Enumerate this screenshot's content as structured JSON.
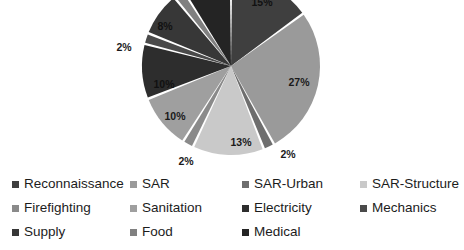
{
  "chart_data": {
    "type": "pie",
    "title": "",
    "legend_position": "bottom",
    "labels": [
      "Reconnaissance",
      "SAR",
      "SAR-Urban",
      "SAR-Structure",
      "Firefighting",
      "Sanitation",
      "Electricity",
      "Mechanics",
      "Supply",
      "Food",
      "Medical"
    ],
    "values": [
      15,
      27,
      2,
      13,
      2,
      10,
      10,
      2,
      8,
      2,
      9
    ],
    "value_labels": [
      "15%",
      "27%",
      "2%",
      "13%",
      "2%",
      "10%",
      "10%",
      "2%",
      "8%",
      "2%",
      "9%"
    ],
    "colors": [
      "#3f3f3f",
      "#9a9a9a",
      "#6e6e6e",
      "#c9c9c9",
      "#8a8a8a",
      "#9f9f9f",
      "#2d2d2d",
      "#4a4a4a",
      "#373737",
      "#808080",
      "#242424"
    ],
    "slices": [
      {
        "label": "Reconnaissance",
        "value": 15,
        "display": "15%",
        "color": "#3f3f3f",
        "label_x": 262,
        "label_y": 3,
        "dark": true
      },
      {
        "label": "SAR",
        "value": 27,
        "display": "27%",
        "color": "#9a9a9a",
        "label_x": 299,
        "label_y": 83,
        "dark": false
      },
      {
        "label": "SAR-Urban",
        "value": 2,
        "display": "2%",
        "color": "#6e6e6e",
        "label_x": 288,
        "label_y": 155,
        "dark": false
      },
      {
        "label": "SAR-Structure",
        "value": 13,
        "display": "13%",
        "color": "#c9c9c9",
        "label_x": 241,
        "label_y": 143,
        "dark": false
      },
      {
        "label": "Firefighting",
        "value": 2,
        "display": "2%",
        "color": "#8a8a8a",
        "label_x": 186,
        "label_y": 162,
        "dark": false
      },
      {
        "label": "Sanitation",
        "value": 10,
        "display": "10%",
        "color": "#9f9f9f",
        "label_x": 175,
        "label_y": 117,
        "dark": false
      },
      {
        "label": "Electricity",
        "value": 10,
        "display": "10%",
        "color": "#2d2d2d",
        "label_x": 164,
        "label_y": 85,
        "dark": true
      },
      {
        "label": "Mechanics",
        "value": 2,
        "display": "2%",
        "color": "#4a4a4a",
        "label_x": 124,
        "label_y": 48,
        "dark": false
      },
      {
        "label": "Supply",
        "value": 8,
        "display": "8%",
        "color": "#373737",
        "label_x": 165,
        "label_y": 27,
        "dark": true
      },
      {
        "label": "Food",
        "value": 2,
        "display": "",
        "color": "#808080",
        "label_x": 196,
        "label_y": 4,
        "dark": true
      },
      {
        "label": "Medical",
        "value": 9,
        "display": "",
        "color": "#242424",
        "label_x": 224,
        "label_y": 2,
        "dark": true
      }
    ],
    "geometry": {
      "cx": 231,
      "cy": 66,
      "r": 89,
      "start_angle": -90,
      "gap_deg": 1.6
    }
  },
  "legend": {
    "items": [
      {
        "label": "Reconnaissance",
        "color": "#3f3f3f"
      },
      {
        "label": "SAR",
        "color": "#9a9a9a"
      },
      {
        "label": "SAR-Urban",
        "color": "#6e6e6e"
      },
      {
        "label": "SAR-Structure",
        "color": "#c9c9c9"
      },
      {
        "label": "Firefighting",
        "color": "#8a8a8a"
      },
      {
        "label": "Sanitation",
        "color": "#9f9f9f"
      },
      {
        "label": "Electricity",
        "color": "#2d2d2d"
      },
      {
        "label": "Mechanics",
        "color": "#4a4a4a"
      },
      {
        "label": "Supply",
        "color": "#373737"
      },
      {
        "label": "Food",
        "color": "#808080"
      },
      {
        "label": "Medical",
        "color": "#242424"
      }
    ]
  }
}
